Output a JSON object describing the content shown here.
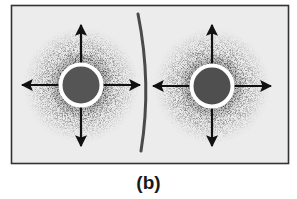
{
  "figure": {
    "panel_label": "(b)",
    "colors": {
      "background": "#ffffff",
      "panel_fill": "#ececec",
      "panel_border": "#333333",
      "halo_dark": "#3a3a3a",
      "core_fill": "#555555",
      "ring": "#ffffff",
      "arrow": "#111111",
      "barrier": "#4a4a4a"
    },
    "panel": {
      "x": 11,
      "y": 5,
      "width": 278,
      "height": 159
    },
    "barrier": {
      "top": [
        138,
        14
      ],
      "mid": [
        146,
        85
      ],
      "bottom": [
        141,
        150
      ]
    },
    "sources": [
      {
        "name": "left-source",
        "cx": 81,
        "cy": 85,
        "ring_radius": 22,
        "core_radius": 18.5,
        "halo_radius": 58,
        "arrows": {
          "up": 25,
          "down": 146,
          "left": 22,
          "right": 140
        }
      },
      {
        "name": "right-source",
        "cx": 212,
        "cy": 86,
        "ring_radius": 22,
        "core_radius": 18.5,
        "halo_radius": 58,
        "arrows": {
          "up": 25,
          "down": 146,
          "left": 153,
          "right": 271
        }
      }
    ]
  }
}
